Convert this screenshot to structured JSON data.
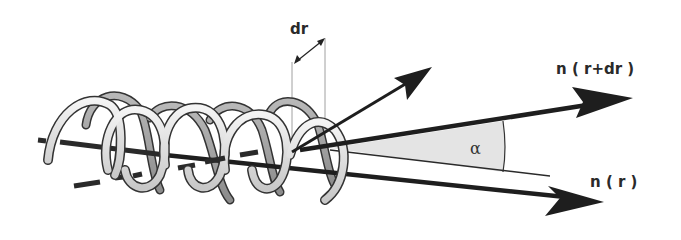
{
  "figure": {
    "type": "director-twist-diagram",
    "labels": {
      "dr": "dr",
      "n_r_plus_dr": "n ( r+dr )",
      "n_r": "n ( r )",
      "alpha": "α"
    },
    "elements": [
      {
        "name": "helix",
        "description": "helical coil along axis"
      },
      {
        "name": "helix-axis",
        "description": "dashed helix axis line"
      },
      {
        "name": "director-n-r-plus-dr",
        "description": "arrow labeled n(r+dr)"
      },
      {
        "name": "director-n-r",
        "description": "arrow labeled n(r)"
      },
      {
        "name": "pitch-vector-arrow",
        "description": "up-right arrow from helix"
      },
      {
        "name": "dr-dimension",
        "description": "double-headed dimension arrow labeled dr"
      },
      {
        "name": "angle-alpha",
        "description": "shaded angle wedge labeled alpha"
      }
    ],
    "colors": {
      "ink": "#1e1e1e",
      "tube_light": "#e8e8e8",
      "tube_dark": "#9a9a9a",
      "wedge_fill": "#e4e4e4"
    }
  }
}
